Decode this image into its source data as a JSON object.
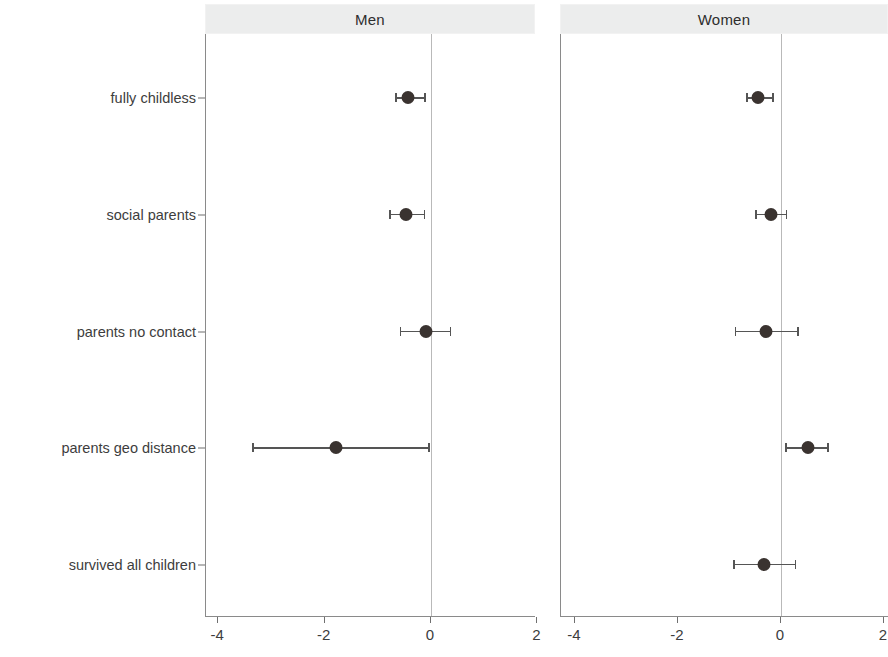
{
  "figure": {
    "panels": [
      {
        "id": "men",
        "label": "Men"
      },
      {
        "id": "women",
        "label": "Women"
      }
    ]
  },
  "chart_data": {
    "type": "scatter",
    "plot_style": "forest-plot / coefficient plot with 95% confidence intervals",
    "title": "",
    "xlabel": "",
    "ylabel": "",
    "xlim": [
      -4.6,
      2.4
    ],
    "xticks": [
      -4,
      -2,
      0,
      2
    ],
    "xticklabels": [
      "-4",
      "-2",
      "0",
      "2"
    ],
    "grid": false,
    "reference_line": 0,
    "legend": "none",
    "facet_labels": [
      "Men",
      "Women"
    ],
    "categories": [
      "fully childless",
      "social parents",
      "parents no contact",
      "parents geo distance",
      "survived all children"
    ],
    "series": [
      {
        "name": "Men",
        "values": [
          -0.43,
          -0.47,
          -0.1,
          -1.78,
          null
        ],
        "ci_lower": [
          -0.66,
          -0.77,
          -0.57,
          -3.35,
          null
        ],
        "ci_upper": [
          -0.11,
          -0.12,
          0.37,
          -0.04,
          null
        ]
      },
      {
        "name": "Women",
        "values": [
          -0.45,
          -0.2,
          -0.3,
          0.52,
          -0.33
        ],
        "ci_lower": [
          -0.66,
          -0.49,
          -0.88,
          0.1,
          -0.91
        ],
        "ci_upper": [
          -0.16,
          0.11,
          0.33,
          0.91,
          0.28
        ]
      }
    ]
  }
}
